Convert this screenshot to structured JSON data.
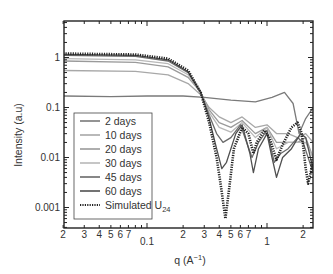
{
  "chart_data": {
    "type": "line",
    "title": "",
    "xlabel": "q (A⁻¹)",
    "ylabel": "Intensity (a.u)",
    "xscale": "log",
    "yscale": "log",
    "xlim": [
      0.02,
      2.42
    ],
    "ylim": [
      0.0004,
      5.5
    ],
    "grid": false,
    "legend_position": "lower-left (inside)",
    "x_tick_labels": [
      {
        "q": 0.02,
        "label": "2"
      },
      {
        "q": 0.03,
        "label": "3"
      },
      {
        "q": 0.04,
        "label": "4"
      },
      {
        "q": 0.05,
        "label": "5"
      },
      {
        "q": 0.06,
        "label": "6"
      },
      {
        "q": 0.07,
        "label": "7"
      },
      {
        "q": 0.1,
        "label": "0.1"
      },
      {
        "q": 0.2,
        "label": "2"
      },
      {
        "q": 0.3,
        "label": "3"
      },
      {
        "q": 0.4,
        "label": "4"
      },
      {
        "q": 0.5,
        "label": "5"
      },
      {
        "q": 0.6,
        "label": "6"
      },
      {
        "q": 0.7,
        "label": "7"
      },
      {
        "q": 1,
        "label": "1"
      },
      {
        "q": 2,
        "label": "2"
      }
    ],
    "y_tick_labels": [
      {
        "I": 1,
        "label": "1"
      },
      {
        "I": 0.1,
        "label": "0.1"
      },
      {
        "I": 0.01,
        "label": "0.01"
      },
      {
        "I": 0.001,
        "label": "0.001"
      }
    ],
    "series": [
      {
        "name": "2 days",
        "color": "#7a7a7a",
        "width": 1.3,
        "dash": "",
        "points": [
          [
            0.02,
            0.17
          ],
          [
            0.05,
            0.165
          ],
          [
            0.1,
            0.17
          ],
          [
            0.2,
            0.17
          ],
          [
            0.3,
            0.16
          ],
          [
            0.5,
            0.14
          ],
          [
            0.8,
            0.13
          ],
          [
            1.1,
            0.16
          ],
          [
            1.4,
            0.2
          ],
          [
            1.65,
            0.12
          ],
          [
            1.85,
            0.03
          ],
          [
            2.1,
            0.06
          ],
          [
            2.42,
            0.1
          ]
        ]
      },
      {
        "name": "10 days",
        "color": "#a8a8a8",
        "width": 1.3,
        "dash": "",
        "points": [
          [
            0.02,
            0.55
          ],
          [
            0.08,
            0.53
          ],
          [
            0.15,
            0.45
          ],
          [
            0.22,
            0.3
          ],
          [
            0.28,
            0.18
          ],
          [
            0.33,
            0.1
          ],
          [
            0.4,
            0.065
          ],
          [
            0.5,
            0.05
          ],
          [
            0.62,
            0.065
          ],
          [
            0.8,
            0.04
          ],
          [
            1.0,
            0.045
          ],
          [
            1.2,
            0.03
          ],
          [
            1.5,
            0.03
          ],
          [
            1.8,
            0.025
          ],
          [
            2.1,
            0.03
          ],
          [
            2.42,
            0.02
          ]
        ]
      },
      {
        "name": "20 days",
        "color": "#9a9a9a",
        "width": 1.3,
        "dash": "",
        "points": [
          [
            0.02,
            0.85
          ],
          [
            0.08,
            0.8
          ],
          [
            0.15,
            0.65
          ],
          [
            0.22,
            0.4
          ],
          [
            0.28,
            0.2
          ],
          [
            0.33,
            0.09
          ],
          [
            0.4,
            0.05
          ],
          [
            0.5,
            0.04
          ],
          [
            0.62,
            0.055
          ],
          [
            0.8,
            0.03
          ],
          [
            1.0,
            0.04
          ],
          [
            1.2,
            0.02
          ],
          [
            1.5,
            0.02
          ],
          [
            1.8,
            0.02
          ],
          [
            2.1,
            0.025
          ],
          [
            2.42,
            0.01
          ]
        ]
      },
      {
        "name": "30 days",
        "color": "#b8b8b8",
        "width": 1.3,
        "dash": "",
        "points": [
          [
            0.02,
            0.95
          ],
          [
            0.08,
            0.9
          ],
          [
            0.15,
            0.75
          ],
          [
            0.22,
            0.45
          ],
          [
            0.28,
            0.2
          ],
          [
            0.33,
            0.08
          ],
          [
            0.4,
            0.04
          ],
          [
            0.5,
            0.032
          ],
          [
            0.62,
            0.05
          ],
          [
            0.8,
            0.025
          ],
          [
            1.0,
            0.04
          ],
          [
            1.2,
            0.015
          ],
          [
            1.5,
            0.02
          ],
          [
            1.8,
            0.02
          ],
          [
            2.1,
            0.02
          ],
          [
            2.42,
            0.01
          ]
        ]
      },
      {
        "name": "45 days",
        "color": "#6a6a6a",
        "width": 1.3,
        "dash": "",
        "points": [
          [
            0.02,
            1.1
          ],
          [
            0.08,
            1.05
          ],
          [
            0.15,
            0.85
          ],
          [
            0.22,
            0.5
          ],
          [
            0.28,
            0.2
          ],
          [
            0.33,
            0.07
          ],
          [
            0.38,
            0.03
          ],
          [
            0.43,
            0.02
          ],
          [
            0.5,
            0.025
          ],
          [
            0.6,
            0.045
          ],
          [
            0.75,
            0.01
          ],
          [
            0.85,
            0.02
          ],
          [
            1.0,
            0.035
          ],
          [
            1.15,
            0.008
          ],
          [
            1.3,
            0.012
          ],
          [
            1.5,
            0.015
          ],
          [
            1.8,
            0.025
          ],
          [
            2.0,
            0.02
          ],
          [
            2.42,
            0.005
          ]
        ]
      },
      {
        "name": "60 days",
        "color": "#505050",
        "width": 1.3,
        "dash": "",
        "points": [
          [
            0.02,
            1.15
          ],
          [
            0.08,
            1.1
          ],
          [
            0.15,
            0.9
          ],
          [
            0.22,
            0.52
          ],
          [
            0.28,
            0.2
          ],
          [
            0.33,
            0.06
          ],
          [
            0.38,
            0.015
          ],
          [
            0.42,
            0.006
          ],
          [
            0.46,
            0.008
          ],
          [
            0.55,
            0.03
          ],
          [
            0.62,
            0.045
          ],
          [
            0.72,
            0.012
          ],
          [
            0.77,
            0.005
          ],
          [
            0.85,
            0.015
          ],
          [
            1.0,
            0.03
          ],
          [
            1.1,
            0.01
          ],
          [
            1.2,
            0.004
          ],
          [
            1.35,
            0.01
          ],
          [
            1.6,
            0.015
          ],
          [
            1.9,
            0.03
          ],
          [
            2.1,
            0.025
          ],
          [
            2.42,
            0.006
          ]
        ]
      },
      {
        "name": "Simulated U24",
        "color": "#222222",
        "width": 2.6,
        "dash": "1.2 1.2",
        "points": [
          [
            0.02,
            1.2
          ],
          [
            0.08,
            1.15
          ],
          [
            0.15,
            0.95
          ],
          [
            0.22,
            0.55
          ],
          [
            0.28,
            0.2
          ],
          [
            0.33,
            0.05
          ],
          [
            0.38,
            0.01
          ],
          [
            0.42,
            0.002
          ],
          [
            0.45,
            0.0006
          ],
          [
            0.48,
            0.002
          ],
          [
            0.53,
            0.015
          ],
          [
            0.62,
            0.04
          ],
          [
            0.7,
            0.03
          ],
          [
            0.77,
            0.012
          ],
          [
            0.82,
            0.02
          ],
          [
            0.95,
            0.035
          ],
          [
            1.05,
            0.025
          ],
          [
            1.2,
            0.009
          ],
          [
            1.35,
            0.018
          ],
          [
            1.6,
            0.04
          ],
          [
            1.8,
            0.05
          ],
          [
            1.95,
            0.03
          ],
          [
            2.1,
            0.006
          ],
          [
            2.2,
            0.003
          ],
          [
            2.42,
            0.008
          ]
        ]
      }
    ]
  },
  "legend": {
    "items": [
      {
        "label": "2 days",
        "color": "#7a7a7a",
        "dashed": false
      },
      {
        "label": "10 days",
        "color": "#a8a8a8",
        "dashed": false
      },
      {
        "label": "20 days",
        "color": "#9a9a9a",
        "dashed": false
      },
      {
        "label": "30 days",
        "color": "#b8b8b8",
        "dashed": false
      },
      {
        "label": "45 days",
        "color": "#6a6a6a",
        "dashed": false
      },
      {
        "label": "60 days",
        "color": "#505050",
        "dashed": false
      },
      {
        "label": "Simulated U",
        "subscript": "24",
        "color": "#222222",
        "dashed": true
      }
    ]
  },
  "axes": {
    "xlabel_main": "q (A",
    "xlabel_sup": "−1",
    "xlabel_close": ")",
    "ylabel": "Intensity (a.u)"
  }
}
